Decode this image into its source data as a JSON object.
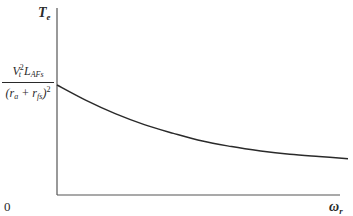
{
  "chart_data": {
    "type": "line",
    "title": "",
    "xlabel": "ω_r",
    "ylabel": "T_e",
    "origin_label": "0",
    "y_intercept_label": {
      "numerator": "V_t^2 L_AFs",
      "denominator": "(r_a + r_fs)^2"
    },
    "grid": false,
    "legend": null,
    "axis_ticks": "none",
    "series": [
      {
        "name": "T_e vs ω_r",
        "description": "monotonically decreasing curve starting at the y-intercept and asymptotically approaching zero",
        "x": [
          0,
          0.1,
          0.2,
          0.3,
          0.4,
          0.5,
          0.6,
          0.7,
          0.8,
          0.9,
          1.0
        ],
        "y": [
          1.0,
          0.86,
          0.74,
          0.64,
          0.56,
          0.49,
          0.44,
          0.4,
          0.37,
          0.35,
          0.33
        ]
      }
    ],
    "xlim": [
      0,
      1.0
    ],
    "ylim": [
      0,
      1.0
    ]
  },
  "labels": {
    "y_axis": "T",
    "y_axis_sub": "e",
    "x_axis": "ω",
    "x_axis_sub": "r",
    "origin": "0",
    "num_v": "V",
    "num_v_sub": "t",
    "num_sq": "2",
    "num_l": "L",
    "num_l_sub": "AFs",
    "den_open": "(r",
    "den_a": "a",
    "den_plus": " + r",
    "den_fs": "fs",
    "den_close": ")",
    "den_sq": "2"
  }
}
